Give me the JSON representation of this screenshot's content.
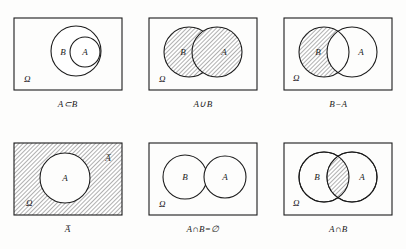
{
  "figure": {
    "panels": [
      {
        "id": "subset",
        "caption": "A⊂B",
        "universe_label": "Ω",
        "labels": {
          "outer": "B",
          "inner": "A"
        },
        "shading": "none",
        "description": "A contained inside B"
      },
      {
        "id": "union",
        "caption": "A∪B",
        "universe_label": "Ω",
        "labels": {
          "left": "B",
          "right": "A"
        },
        "shading": "both-circles",
        "description": "union of A and B shaded"
      },
      {
        "id": "difference",
        "caption": "B−A",
        "universe_label": "Ω",
        "labels": {
          "left": "B",
          "right": "A"
        },
        "shading": "left-circle-minus-overlap",
        "description": "B minus A shaded"
      },
      {
        "id": "complement",
        "caption": "A̅",
        "universe_label": "Ω",
        "labels": {
          "inner": "A",
          "corner": "A̅"
        },
        "shading": "rectangle-minus-circle",
        "description": "complement of A shaded"
      },
      {
        "id": "disjoint",
        "caption": "A∩B=∅",
        "universe_label": "Ω",
        "labels": {
          "left": "B",
          "right": "A"
        },
        "shading": "none",
        "description": "disjoint circles, empty intersection"
      },
      {
        "id": "intersection",
        "caption": "A∩B",
        "universe_label": "Ω",
        "labels": {
          "left": "B",
          "right": "A"
        },
        "shading": "overlap-only",
        "description": "intersection lens shaded"
      }
    ],
    "colors": {
      "ink": "#1c1c1c",
      "paper": "#fdfdfc",
      "hatch": "#9a9a9a"
    }
  }
}
